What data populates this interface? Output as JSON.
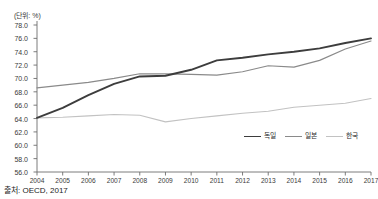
{
  "unit_label": "(단위: %)",
  "source_note": "출처: OECD, 2017",
  "legend": {
    "items": [
      {
        "label": "독일",
        "color": "#3d3d3d",
        "width": 1.9
      },
      {
        "label": "일본",
        "color": "#8a8a8a",
        "width": 1.2
      },
      {
        "label": "한국",
        "color": "#c2c2c2",
        "width": 1.1
      }
    ]
  },
  "chart_data": {
    "type": "line",
    "title": "",
    "xlabel": "",
    "ylabel": "",
    "unit": "%",
    "grid": false,
    "legend_position": "bottom-right",
    "x": [
      2004,
      2005,
      2006,
      2007,
      2008,
      2009,
      2010,
      2011,
      2012,
      2013,
      2014,
      2015,
      2016,
      2017
    ],
    "xlim": [
      2004,
      2017
    ],
    "ylim": [
      56.0,
      78.0
    ],
    "yticks": [
      56.0,
      58.0,
      60.0,
      62.0,
      64.0,
      66.0,
      68.0,
      70.0,
      72.0,
      74.0,
      76.0,
      78.0
    ],
    "ytick_labels": [
      "56.0",
      "58.0",
      "60.0",
      "62.0",
      "64.0",
      "66.0",
      "68.0",
      "70.0",
      "72.0",
      "74.0",
      "76.0",
      "78.0"
    ],
    "xtick_labels": [
      "2004",
      "2005",
      "2006",
      "2007",
      "2008",
      "2009",
      "2010",
      "2011",
      "2012",
      "2013",
      "2014",
      "2015",
      "2016",
      "2017"
    ],
    "series": [
      {
        "name": "독일",
        "color": "#3d3d3d",
        "width": 1.9,
        "values": [
          64.1,
          65.6,
          67.5,
          69.2,
          70.3,
          70.4,
          71.3,
          72.7,
          73.1,
          73.6,
          74.0,
          74.5,
          75.3,
          76.0
        ]
      },
      {
        "name": "일본",
        "color": "#8a8a8a",
        "width": 1.2,
        "values": [
          68.6,
          69.0,
          69.4,
          70.0,
          70.7,
          70.7,
          70.6,
          70.5,
          71.0,
          71.9,
          71.7,
          72.7,
          74.4,
          75.6
        ]
      },
      {
        "name": "한국",
        "color": "#c2c2c2",
        "width": 1.1,
        "values": [
          64.1,
          64.2,
          64.4,
          64.6,
          64.5,
          63.5,
          64.0,
          64.4,
          64.8,
          65.1,
          65.7,
          66.0,
          66.3,
          67.0
        ]
      }
    ]
  }
}
